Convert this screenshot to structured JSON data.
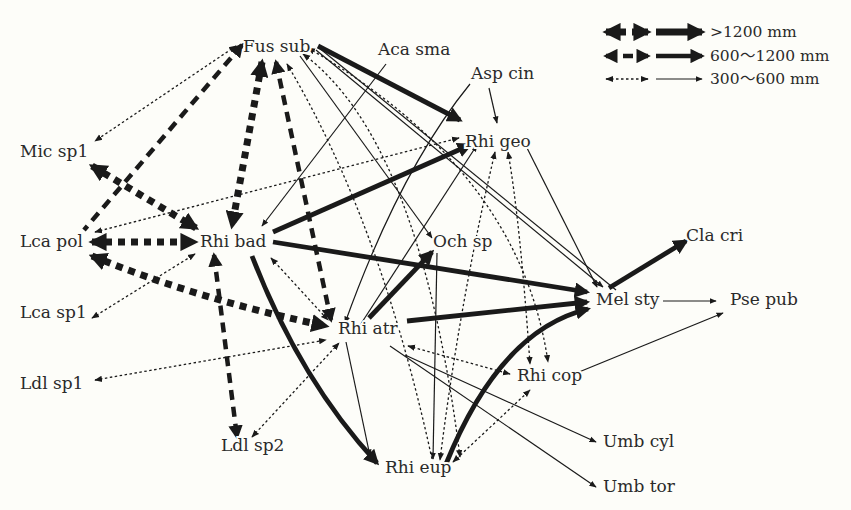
{
  "colors": {
    "background": "#fdfdf9",
    "ink": "#1a1a1a",
    "text": "#2a2a2a"
  },
  "legend": {
    "items": [
      {
        "label": ">1200 mm",
        "level": "thick",
        "y": 32
      },
      {
        "label": "600〜1200 mm",
        "level": "medium",
        "y": 56
      },
      {
        "label": "300〜600 mm",
        "level": "thin",
        "y": 79
      }
    ]
  },
  "nodes": [
    {
      "id": "fus_sub",
      "label": "Fus sub",
      "x": 243,
      "y": 52
    },
    {
      "id": "aca_sma",
      "label": "Aca sma",
      "x": 378,
      "y": 55
    },
    {
      "id": "asp_cin",
      "label": "Asp cin",
      "x": 471,
      "y": 79
    },
    {
      "id": "mic_sp1",
      "label": "Mic sp1",
      "x": 20,
      "y": 157
    },
    {
      "id": "rhi_geo",
      "label": "Rhi geo",
      "x": 465,
      "y": 147
    },
    {
      "id": "lca_pol",
      "label": "Lca pol",
      "x": 20,
      "y": 247
    },
    {
      "id": "rhi_bad",
      "label": "Rhi bad",
      "x": 200,
      "y": 247
    },
    {
      "id": "och_sp",
      "label": "Och sp",
      "x": 433,
      "y": 247
    },
    {
      "id": "cla_cri",
      "label": "Cla cri",
      "x": 686,
      "y": 241
    },
    {
      "id": "lca_sp1",
      "label": "Lca sp1",
      "x": 20,
      "y": 318
    },
    {
      "id": "mel_sty",
      "label": "Mel sty",
      "x": 596,
      "y": 305
    },
    {
      "id": "pse_pub",
      "label": "Pse pub",
      "x": 730,
      "y": 305
    },
    {
      "id": "rhi_atr",
      "label": "Rhi atr",
      "x": 338,
      "y": 334
    },
    {
      "id": "ldl_sp1",
      "label": "Ldl sp1",
      "x": 20,
      "y": 389
    },
    {
      "id": "rhi_cop",
      "label": "Rhi cop",
      "x": 517,
      "y": 381
    },
    {
      "id": "ldl_sp2",
      "label": "Ldl sp2",
      "x": 221,
      "y": 451
    },
    {
      "id": "umb_cyl",
      "label": "Umb cyl",
      "x": 603,
      "y": 447
    },
    {
      "id": "rhi_eup",
      "label": "Rhi eup",
      "x": 385,
      "y": 473
    },
    {
      "id": "umb_tor",
      "label": "Umb tor",
      "x": 603,
      "y": 492
    }
  ],
  "edges": [
    {
      "path": "M236,46 L95,141",
      "style": "thin-dash",
      "end": true,
      "start": true
    },
    {
      "path": "M242,45 L84,230",
      "style": "medium-dash",
      "end": false,
      "start": true,
      "startArrow": true,
      "endArrow": true
    },
    {
      "path": "M262,62 L232,226",
      "style": "thick-dash",
      "start": true,
      "end": true
    },
    {
      "path": "M276,62 L331,320",
      "style": "medium-dash",
      "start": true,
      "end": true
    },
    {
      "path": "M287,64 Q380,220 432,459",
      "style": "thin-dash",
      "start": true,
      "end": false
    },
    {
      "path": "M92,166 L196,228",
      "style": "thick-dash",
      "start": true,
      "end": true
    },
    {
      "path": "M92,242 L195,242",
      "style": "thick-dash",
      "start": true,
      "end": true
    },
    {
      "path": "M92,256 Q200,300 326,326",
      "style": "thick-dash",
      "start": true,
      "end": true
    },
    {
      "path": "M214,255 L237,437",
      "style": "medium-dash",
      "start": true,
      "end": true
    },
    {
      "path": "M263,233 L247,230",
      "style": "none"
    },
    {
      "path": "M318,46 L460,120",
      "style": "thick-solid",
      "end": true
    },
    {
      "path": "M303,54 Q420,140 460,457",
      "style": "thin-dash",
      "start": true,
      "end": true
    },
    {
      "path": "M300,56 L432,238",
      "style": "thin-solid",
      "end": true
    },
    {
      "path": "M308,48 Q520,170 548,362",
      "style": "thin-dash",
      "start": true,
      "end": true
    },
    {
      "path": "M316,50 L603,287",
      "style": "thin-solid",
      "end": true
    },
    {
      "path": "M318,47 L616,290",
      "style": "thin-solid",
      "end": false
    },
    {
      "path": "M386,64 L262,226",
      "style": "thin-solid",
      "end": true
    },
    {
      "path": "M470,84 Q400,170 345,323",
      "style": "thin-solid",
      "end": true
    },
    {
      "path": "M489,88 L497,123",
      "style": "thin-solid",
      "end": true
    },
    {
      "path": "M95,232 L459,138",
      "style": "thin-dash",
      "start": true,
      "end": true
    },
    {
      "path": "M273,232 L470,145",
      "style": "thick-solid",
      "end": true
    },
    {
      "path": "M355,333 L477,145",
      "style": "thin-solid",
      "end": true
    },
    {
      "path": "M508,152 Q520,220 530,364",
      "style": "thin-dash",
      "start": true,
      "end": true
    },
    {
      "path": "M495,152 Q460,300 440,460",
      "style": "thin-dash",
      "start": true,
      "end": true
    },
    {
      "path": "M526,146 L597,287",
      "style": "thin-solid",
      "end": true
    },
    {
      "path": "M273,242 L587,292",
      "style": "thick-solid",
      "end": true
    },
    {
      "path": "M252,256 Q300,380 377,463",
      "style": "thick-solid",
      "end": true
    },
    {
      "path": "M271,258 L328,320",
      "style": "thin-dash",
      "start": true,
      "end": true
    },
    {
      "path": "M92,318 L195,254",
      "style": "thin-dash",
      "start": true,
      "end": true
    },
    {
      "path": "M95,380 L326,340",
      "style": "thin-dash",
      "start": true,
      "end": true
    },
    {
      "path": "M252,437 L339,343",
      "style": "thin-dash",
      "start": true,
      "end": true
    },
    {
      "path": "M369,318 L432,252",
      "style": "thick-solid",
      "end": true
    },
    {
      "path": "M407,321 L587,302",
      "style": "thick-solid",
      "end": true
    },
    {
      "path": "M346,342 L370,456",
      "style": "thin-solid",
      "end": true
    },
    {
      "path": "M405,355 L596,442",
      "style": "thin-solid",
      "end": true
    },
    {
      "path": "M390,346 L596,487",
      "style": "thin-solid",
      "end": true
    },
    {
      "path": "M408,346 L510,374",
      "style": "thin-dash",
      "start": true,
      "end": true
    },
    {
      "path": "M437,253 L433,459",
      "style": "thin-solid",
      "end": true
    },
    {
      "path": "M446,464 Q500,330 588,309",
      "style": "thick-solid",
      "end": true
    },
    {
      "path": "M453,462 L530,390",
      "style": "thin-dash",
      "start": true,
      "end": true
    },
    {
      "path": "M579,372 L723,313",
      "style": "thin-solid",
      "end": true
    },
    {
      "path": "M609,288 L686,241",
      "style": "thick-solid",
      "end": true
    },
    {
      "path": "M663,301 L716,301",
      "style": "thin-solid",
      "end": true
    }
  ]
}
